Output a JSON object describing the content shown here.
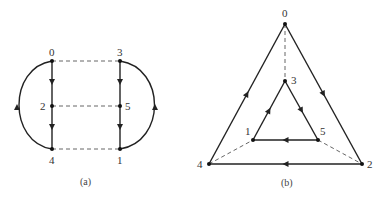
{
  "figure_a": {
    "caption": "(a)",
    "nodes": [
      {
        "id": "0",
        "label": "0",
        "x": 52,
        "y": 61
      },
      {
        "id": "2",
        "label": "2",
        "x": 52,
        "y": 106
      },
      {
        "id": "4",
        "label": "4",
        "x": 52,
        "y": 149
      },
      {
        "id": "3",
        "label": "3",
        "x": 120,
        "y": 61
      },
      {
        "id": "5",
        "label": "5",
        "x": 120,
        "y": 106
      },
      {
        "id": "1",
        "label": "1",
        "x": 120,
        "y": 149
      }
    ],
    "directed_edges": [
      {
        "from": "0",
        "to": "2"
      },
      {
        "from": "2",
        "to": "4"
      },
      {
        "from": "4",
        "to": "0",
        "style": "left-arc"
      },
      {
        "from": "3",
        "to": "5"
      },
      {
        "from": "5",
        "to": "1"
      },
      {
        "from": "1",
        "to": "3",
        "style": "right-arc"
      }
    ],
    "dashed_edges": [
      {
        "from": "0",
        "to": "3"
      },
      {
        "from": "2",
        "to": "5"
      },
      {
        "from": "4",
        "to": "1"
      }
    ]
  },
  "figure_b": {
    "caption": "(b)",
    "nodes": [
      {
        "id": "0",
        "label": "0",
        "x": 285,
        "y": 24
      },
      {
        "id": "3",
        "label": "3",
        "x": 285,
        "y": 81
      },
      {
        "id": "1",
        "label": "1",
        "x": 253,
        "y": 140
      },
      {
        "id": "5",
        "label": "5",
        "x": 318,
        "y": 140
      },
      {
        "id": "4",
        "label": "4",
        "x": 209,
        "y": 164
      },
      {
        "id": "2",
        "label": "2",
        "x": 362,
        "y": 164
      }
    ],
    "directed_edges": [
      {
        "from": "0",
        "to": "2"
      },
      {
        "from": "2",
        "to": "4"
      },
      {
        "from": "4",
        "to": "0"
      },
      {
        "from": "3",
        "to": "5"
      },
      {
        "from": "5",
        "to": "1"
      },
      {
        "from": "1",
        "to": "3"
      }
    ],
    "dashed_edges": [
      {
        "from": "0",
        "to": "3"
      },
      {
        "from": "4",
        "to": "1"
      },
      {
        "from": "5",
        "to": "2"
      }
    ]
  }
}
